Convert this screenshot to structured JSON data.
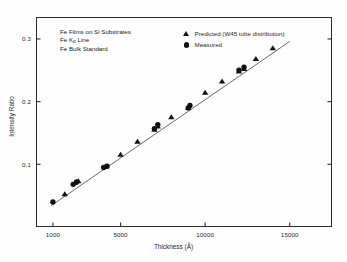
{
  "figure": {
    "annotations": [
      {
        "text": "Fe Films on Si Substrates"
      },
      {
        "text_before": "Fe K",
        "subscript": "α",
        "text_after": " Line"
      },
      {
        "text": "Fe Bulk Standard"
      }
    ],
    "legend": [
      {
        "marker": "triangle-marker",
        "label": "Predicted (W45 tube distribution)"
      },
      {
        "marker": "circle-marker",
        "label": "Measured"
      }
    ],
    "colors": {
      "marker": "#111111",
      "axis": "#2b2b2b",
      "trend_line": "#3a3a3a",
      "background": "#fefefe"
    }
  },
  "chart_data": {
    "type": "scatter",
    "title": "",
    "xlabel": "Thickness (Å)",
    "ylabel": "Intensity Ratio",
    "xlim": [
      0,
      17500
    ],
    "ylim": [
      0,
      0.335
    ],
    "grid": false,
    "legend_position": "top-right",
    "xticks": [
      1000,
      5000,
      10000,
      15000
    ],
    "xtick_labels": [
      "1000",
      "5000",
      "10000",
      "15000"
    ],
    "yticks": [
      0.1,
      0.2,
      0.3
    ],
    "ytick_labels": [
      "0.1",
      "0.2",
      "0.3"
    ],
    "series": [
      {
        "name": "Predicted (W45 tube distribution)",
        "marker": "triangle",
        "x": [
          1700,
          2300,
          2500,
          4100,
          5000,
          6000,
          7000,
          7200,
          8000,
          9000,
          10000,
          11000,
          12000,
          12300,
          13000,
          14000
        ],
        "y": [
          0.052,
          0.07,
          0.073,
          0.096,
          0.115,
          0.136,
          0.155,
          0.16,
          0.175,
          0.19,
          0.214,
          0.232,
          0.248,
          0.252,
          0.268,
          0.285
        ]
      },
      {
        "name": "Measured",
        "marker": "circle",
        "x": [
          1000,
          2200,
          2400,
          4000,
          4200,
          7000,
          7200,
          9000,
          9100,
          12000,
          12300
        ],
        "y": [
          0.04,
          0.068,
          0.072,
          0.095,
          0.097,
          0.157,
          0.163,
          0.19,
          0.194,
          0.25,
          0.255
        ]
      }
    ],
    "trend_line": {
      "name": "fit line",
      "x": [
        900,
        15000
      ],
      "y": [
        0.034,
        0.296
      ]
    }
  }
}
